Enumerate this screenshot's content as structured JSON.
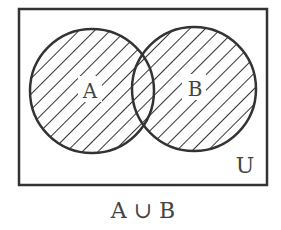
{
  "diagram": {
    "type": "venn",
    "universe_label": "U",
    "sets": [
      {
        "label": "A",
        "cx": 92,
        "cy": 91,
        "r": 62
      },
      {
        "label": "B",
        "cx": 194,
        "cy": 89,
        "r": 62
      }
    ],
    "shaded_region": "union",
    "caption": "A ∪ B",
    "colors": {
      "stroke": "#333333",
      "hatch": "#333333",
      "text": "#444444",
      "background": "#ffffff"
    }
  }
}
